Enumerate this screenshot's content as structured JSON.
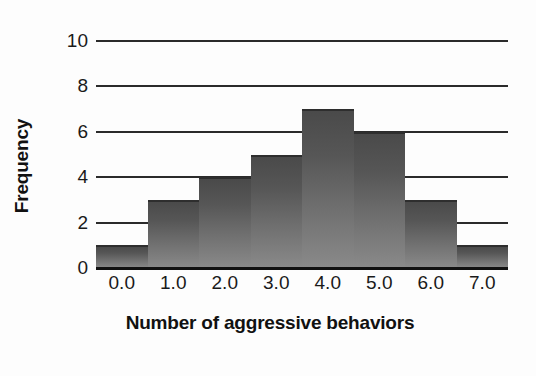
{
  "chart_data": {
    "type": "bar",
    "title": "",
    "subtitle": "",
    "xlabel": "Number of aggressive behaviors",
    "ylabel": "Frequency",
    "categories": [
      "0.0",
      "1.0",
      "2.0",
      "3.0",
      "4.0",
      "5.0",
      "6.0",
      "7.0"
    ],
    "values": [
      1,
      3,
      4,
      5,
      7,
      6,
      3,
      1
    ],
    "x_tick_labels": [
      "0.0",
      "1.0",
      "2.0",
      "3.0",
      "4.0",
      "5.0",
      "6.0",
      "7.0"
    ],
    "y_tick_labels": [
      "0",
      "2",
      "4",
      "6",
      "8",
      "10"
    ],
    "y_tick_values": [
      0,
      2,
      4,
      6,
      8,
      10
    ],
    "ylim": [
      0,
      10
    ],
    "xlim": [
      -0.5,
      7.5
    ],
    "grid": true,
    "grid_axis": "y",
    "legend": false,
    "legend_position": "none",
    "bar_fill_top_color": "#4a4a4a",
    "bar_fill_bottom_color": "#8a8a8a",
    "bar_edge_color": "#2e2e2e",
    "gridline_color": "#2b2b2b",
    "axis_color": "#111111",
    "background_color": "#fdfdfd",
    "text_color": "#1a1a1a",
    "bin_width": 1
  }
}
